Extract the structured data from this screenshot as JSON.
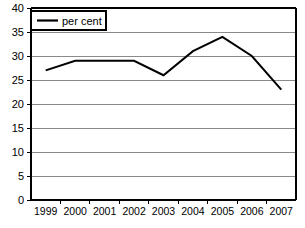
{
  "chart_data": {
    "type": "line",
    "title": "",
    "subtitle": "",
    "xlabel": "",
    "ylabel": "",
    "categories": [
      "1999",
      "2000",
      "2001",
      "2002",
      "2003",
      "2004",
      "2005",
      "2006",
      "2007"
    ],
    "series": [
      {
        "name": "per cent",
        "values": [
          27,
          29,
          29,
          29,
          26,
          31,
          34,
          30,
          23
        ],
        "color": "#000000"
      }
    ],
    "ylim": [
      0,
      40
    ],
    "ytick_values": [
      0,
      5,
      10,
      15,
      20,
      25,
      30,
      35,
      40
    ],
    "ytick_labels": [
      "0",
      "5",
      "10",
      "15",
      "20",
      "25",
      "30",
      "35",
      "40"
    ],
    "grid": true,
    "grid_axis": "y",
    "grid_color": "#8a8a8a",
    "legend_position": "top-left",
    "legend_entries": [
      "per cent"
    ],
    "annotations": [],
    "background_color": "#ffffff",
    "axis_color": "#000000"
  },
  "legend": {
    "series_label": "per cent"
  }
}
